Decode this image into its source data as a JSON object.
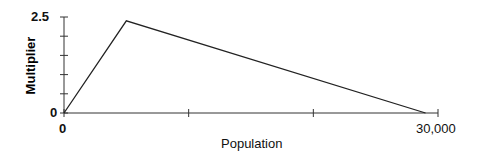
{
  "chart_data": {
    "type": "line",
    "title": "",
    "xlabel": "Population",
    "ylabel": "Multiplier",
    "xlim": [
      0,
      30000
    ],
    "ylim": [
      0,
      2.5
    ],
    "x_tick_labels": [
      "0",
      "30,000"
    ],
    "y_tick_labels": [
      "0",
      "2.5"
    ],
    "x_ticks": [
      0,
      10000,
      20000,
      30000
    ],
    "y_ticks": [
      0,
      0.5,
      1.0,
      1.5,
      2.0,
      2.5
    ],
    "grid": false,
    "legend": null,
    "series": [
      {
        "name": "Multiplier",
        "x": [
          0,
          5000,
          29000
        ],
        "y": [
          0,
          2.4,
          0
        ]
      }
    ],
    "colors": {
      "line": "#222222",
      "axis": "#333333"
    }
  }
}
